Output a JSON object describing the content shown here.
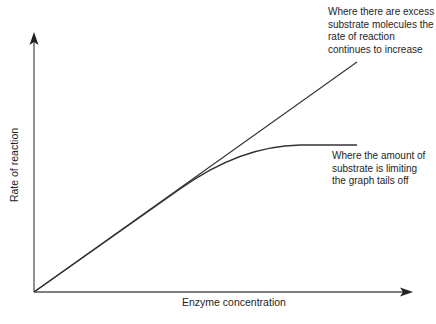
{
  "diagram": {
    "xlabel": "Enzyme concentration",
    "ylabel": "Rate of reaction",
    "annotations": {
      "excess_substrate": "Where there are excess\nsubstrate molecules the\nrate of reaction\ncontinues to increase",
      "limiting_substrate": "Where the amount of\nsubstrate is limiting\nthe graph tails off"
    },
    "lines": [
      {
        "name": "excess-substrate-line",
        "shape": "straight",
        "description": "Linear increase"
      },
      {
        "name": "limiting-substrate-curve",
        "shape": "curve",
        "description": "Levels off / plateaus"
      }
    ],
    "colors": {
      "axis": "#555555",
      "line": "#333333",
      "text": "#1e1e1e",
      "background": "#ffffff"
    }
  }
}
